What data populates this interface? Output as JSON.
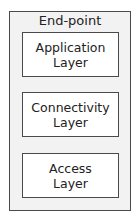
{
  "diagram": {
    "container": {
      "title": "End-point"
    },
    "layers": [
      {
        "label": "Application\nLayer"
      },
      {
        "label": "Connectivity\nLayer"
      },
      {
        "label": "Access\nLayer"
      }
    ],
    "colors": {
      "container_fill": "#f2f2f2",
      "box_fill": "#ffffff",
      "border": "#4a4a4a",
      "text": "#222222"
    }
  }
}
